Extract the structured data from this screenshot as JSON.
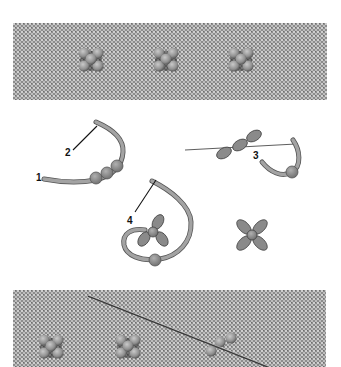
{
  "figure": {
    "type": "embroidery stitch instruction illustration",
    "panels": [
      {
        "id": "top-photo",
        "description": "Finished beaded flower stitches on linen fabric",
        "flower_count": 3
      },
      {
        "id": "diagram",
        "description": "Step-by-step thread diagrams"
      },
      {
        "id": "bottom-photo",
        "description": "Beaded flowers on fabric with needle inserted",
        "flower_count": 3
      }
    ],
    "step_labels": [
      "1",
      "2",
      "3",
      "4"
    ]
  },
  "diagram": {
    "labels": {
      "one": "1",
      "two": "2",
      "three": "3",
      "four": "4"
    }
  },
  "colors": {
    "background": "#ffffff",
    "fabric": "#9a9a9a",
    "fabric_light": "#c8c8c8",
    "thread": "#9b9b9b",
    "thread_outline": "#555555",
    "bead": "#8a8a8a",
    "label": "#111111"
  }
}
